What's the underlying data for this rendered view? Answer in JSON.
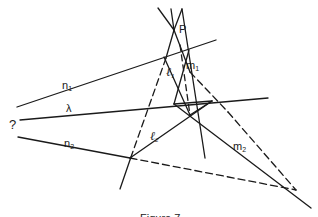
{
  "diagram": {
    "labels": {
      "P": "P",
      "n1": "n",
      "n1_sub": "1",
      "lambda": "λ",
      "question": "?",
      "n2": "n",
      "n2_sub": "2",
      "l1": "ℓ",
      "l1_sub": "1",
      "m1": "m",
      "m1_sub": "1",
      "l2": "ℓ",
      "l2_sub": "2",
      "m2": "m",
      "m2_sub": "2"
    },
    "caption": "Figure 7",
    "stroke_color": "#1a1a1a"
  }
}
